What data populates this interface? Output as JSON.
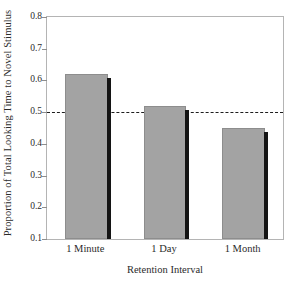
{
  "chart_data": {
    "type": "bar",
    "title": "",
    "subtitle": "",
    "categories": [
      "1 Minute",
      "1 Day",
      "1 Month"
    ],
    "values": [
      0.62,
      0.52,
      0.45
    ],
    "series": [
      {
        "name": "Proportion of Total Looking Time to Novel Stimulus",
        "values": [
          0.62,
          0.52,
          0.45
        ]
      }
    ],
    "xlabel": "Retention Interval",
    "ylabel": "Proportion of Total Looking Time to Novel Stimulus",
    "ylim": [
      0.1,
      0.8
    ],
    "ytick_labels": [
      "0.8",
      "0.7",
      "0.6",
      "0.5",
      "0.4",
      "0.3",
      "0.2",
      "0.1"
    ],
    "ytick_values": [
      0.8,
      0.7,
      0.6,
      0.5,
      0.4,
      0.3,
      0.2,
      0.1
    ],
    "grid": false,
    "legend": false,
    "legend_position": "none",
    "annotations": [
      {
        "kind": "reference-line",
        "orientation": "horizontal",
        "value": 0.5,
        "style": "dashed",
        "color": "#1d1d1d",
        "label": ""
      }
    ],
    "bar_fill_color": "#a3a3a3",
    "bar_edge_color": "#8d8d8d",
    "bar_shadow_color": "#141414",
    "frame_color": "#b4b4b4",
    "background_color": "#ffffff",
    "text_color": "#2b2b2b"
  }
}
